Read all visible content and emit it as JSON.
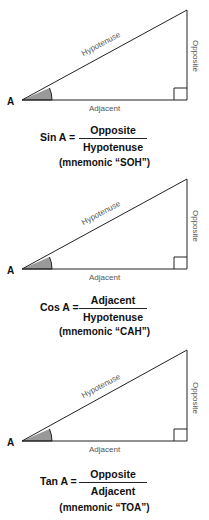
{
  "panels": [
    {
      "vertex_label": "A",
      "hypotenuse_label": "Hypotenuse",
      "opposite_label": "Opposite",
      "adjacent_label": "Adjacent",
      "formula_lhs": "Sin A =",
      "numerator": "Opposite",
      "denominator": "Hypotenuse",
      "mnemonic": "(mnemonic “SOH”)"
    },
    {
      "vertex_label": "A",
      "hypotenuse_label": "Hypotenuse",
      "opposite_label": "Opposite",
      "adjacent_label": "Adjacent",
      "formula_lhs": "Cos A =",
      "numerator": "Adjacent",
      "denominator": "Hypotenuse",
      "mnemonic": "(mnemonic “CAH”)"
    },
    {
      "vertex_label": "A",
      "hypotenuse_label": "Hypotenuse",
      "opposite_label": "Opposite",
      "adjacent_label": "Adjacent",
      "formula_lhs": "Tan A =",
      "numerator": "Opposite",
      "denominator": "Adjacent",
      "mnemonic": "(mnemonic “TOA”)"
    }
  ],
  "colors": {
    "line": "#222222",
    "angle_fill": "#999999",
    "label": "#555555"
  }
}
